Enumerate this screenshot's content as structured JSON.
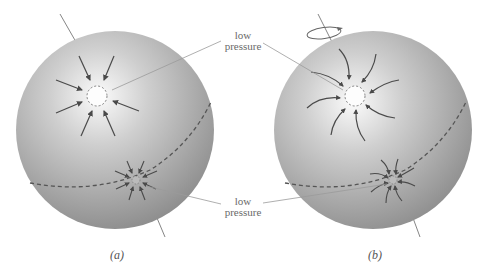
{
  "figure": {
    "panel_a": {
      "caption": "(a)",
      "description": "non-rotating sphere, winds flow straight into low pressure"
    },
    "panel_b": {
      "caption": "(b)",
      "description": "rotating sphere, winds deflected into spirals"
    },
    "labels": {
      "top": {
        "line1": "low",
        "line2": "pressure"
      },
      "bottom": {
        "line1": "low",
        "line2": "pressure"
      }
    },
    "colors": {
      "sphere_light": "#f6f6f6",
      "sphere_dark": "#8a8a8a",
      "arrow": "#4a4a4a",
      "equator": "#555555",
      "leader": "#9a9a9a"
    },
    "icons": [
      "rotation-arrow-icon"
    ]
  }
}
